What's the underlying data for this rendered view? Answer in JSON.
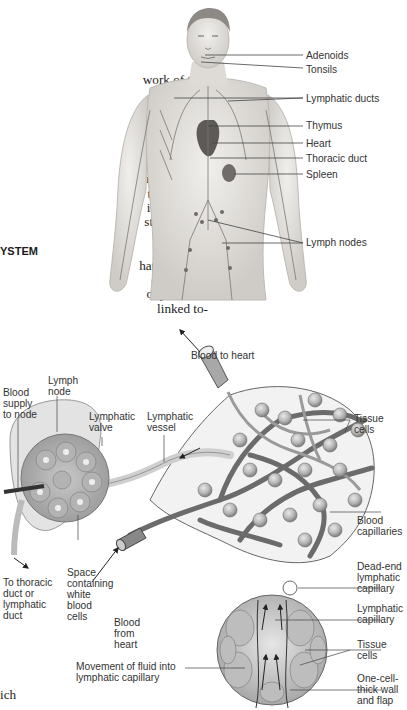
{
  "page": {
    "body_text_lines": [
      "work of tiny",
      "that branch",
      "hatic vessels",
      "s and return",
      "hatic system",
      "blood and",
      "s considered",
      "n. The lym-",
      "tion, by ab-",
      "ients, and it",
      "stem, which",
      "infection."
    ],
    "section_heading": "YSTEM",
    "body_text_lines_2": [
      "hatic system,",
      "ch through",
      "ody. Unlike",
      "linked to-"
    ],
    "footer_text": "ich"
  },
  "figure_top": {
    "title": "Human lymphatic system",
    "labels": {
      "adenoids": "Adenoids",
      "tonsils": "Tonsils",
      "lymphatic_ducts": "Lymphatic ducts",
      "thymus": "Thymus",
      "heart": "Heart",
      "thoracic_duct": "Thoracic duct",
      "spleen": "Spleen",
      "lymph_nodes": "Lymph nodes"
    }
  },
  "figure_bottom": {
    "title": "Lymph node and capillary network",
    "labels": {
      "blood_to_heart": "Blood to heart",
      "lymph_node": [
        "Lymph",
        "node"
      ],
      "blood_supply": [
        "Blood",
        "supply",
        "to node"
      ],
      "lymphatic_valve": [
        "Lymphatic",
        "valve"
      ],
      "lymphatic_vessel": [
        "Lymphatic",
        "vessel"
      ],
      "tissue_cells_top": [
        "Tissue",
        "cells"
      ],
      "blood_capillaries": [
        "Blood",
        "capillaries"
      ],
      "dead_end": [
        "Dead-end",
        "lymphatic",
        "capillary"
      ],
      "lymphatic_capillary": [
        "Lymphatic",
        "capillary"
      ],
      "tissue_cells_bottom": [
        "Tissue",
        "cells"
      ],
      "one_cell_wall": [
        "One-cell-",
        "thick wall",
        "and flap"
      ],
      "to_thoracic": [
        "To thoracic",
        "duct or",
        "lymphatic",
        "duct"
      ],
      "space_containing": [
        "Space",
        "containing",
        "white",
        "blood",
        "cells"
      ],
      "blood_from_heart": [
        "Blood",
        "from",
        "heart"
      ],
      "movement_fluid": [
        "Movement of fluid into",
        "lymphatic capillary"
      ]
    }
  },
  "colors": {
    "skin": "#e4e2de",
    "vessel": "#8a8a8a",
    "dark_vessel": "#555555",
    "label_line": "#555555"
  }
}
